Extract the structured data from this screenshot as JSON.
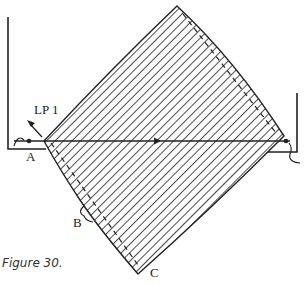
{
  "figure": {
    "caption": "Figure 30.",
    "labels": {
      "lp1": "LP 1",
      "a": "A",
      "b": "B",
      "c": "C"
    },
    "colors": {
      "stroke": "#222222",
      "background": "#ffffff"
    }
  }
}
